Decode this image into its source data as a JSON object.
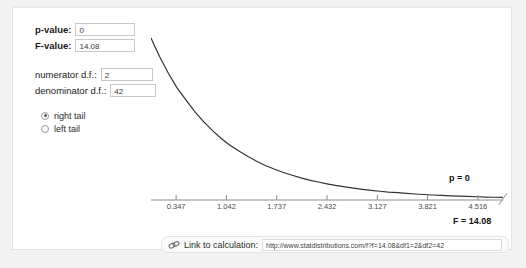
{
  "panel": {
    "form": {
      "p_value_label": "p-value:",
      "p_value": "0",
      "f_value_label": "F-value:",
      "f_value": "14.08",
      "numerator_label": "numerator d.f.:",
      "numerator_df": "2",
      "denominator_label": "denominator d.f.:",
      "denominator_df": "42"
    },
    "tail_options": [
      {
        "label": "right tail",
        "selected": true
      },
      {
        "label": "left tail",
        "selected": false
      }
    ],
    "plot_labels": {
      "p_annotation": "p = 0",
      "f_annotation": "F = 14.08"
    },
    "link_bar": {
      "icon": "chain-link-icon",
      "label": "Link to calculation:",
      "url": "http://www.statdistributions.com/f?f=14.08&df1=2&df2=42"
    }
  },
  "colors": {
    "curve": "#333333",
    "axis": "#8c8c8c",
    "panel_bg": "#ffffff",
    "page_bg": "#f3f3f3",
    "field_border": "#c8c8c8"
  },
  "chart_data": {
    "type": "line",
    "title": "",
    "xlabel": "",
    "ylabel": "",
    "distribution": "F-distribution density",
    "df1": 2,
    "df2": 42,
    "xlim": [
      0,
      4.863
    ],
    "ylim": [
      0,
      1.0
    ],
    "grid": false,
    "legend": null,
    "xticks": [
      0.347,
      1.042,
      1.737,
      2.432,
      3.127,
      3.821,
      4.516
    ],
    "xticklabels": [
      "0.347",
      "1.042",
      "1.737",
      "2.432",
      "3.127",
      "3.821",
      "4.516"
    ],
    "annotations": [
      {
        "text": "p = 0",
        "x": 4.516,
        "y": 0.13
      },
      {
        "text": "F = 14.08",
        "x": 4.863,
        "y": -0.08
      }
    ],
    "x": [
      0.0,
      0.12,
      0.24,
      0.36,
      0.49,
      0.61,
      0.73,
      0.85,
      0.97,
      1.09,
      1.22,
      1.34,
      1.46,
      1.58,
      1.7,
      1.82,
      1.95,
      2.07,
      2.19,
      2.31,
      2.43,
      2.55,
      2.68,
      2.8,
      2.92,
      3.04,
      3.16,
      3.28,
      3.41,
      3.53,
      3.65,
      3.77,
      3.89,
      4.01,
      4.14,
      4.26,
      4.38,
      4.5,
      4.62,
      4.74,
      4.86
    ],
    "y": [
      1.0,
      0.884,
      0.782,
      0.692,
      0.613,
      0.543,
      0.482,
      0.428,
      0.38,
      0.338,
      0.301,
      0.268,
      0.239,
      0.213,
      0.191,
      0.171,
      0.153,
      0.137,
      0.123,
      0.111,
      0.1,
      0.09,
      0.081,
      0.073,
      0.066,
      0.06,
      0.054,
      0.049,
      0.045,
      0.041,
      0.037,
      0.034,
      0.031,
      0.028,
      0.026,
      0.024,
      0.022,
      0.02,
      0.018,
      0.017,
      0.016
    ]
  }
}
